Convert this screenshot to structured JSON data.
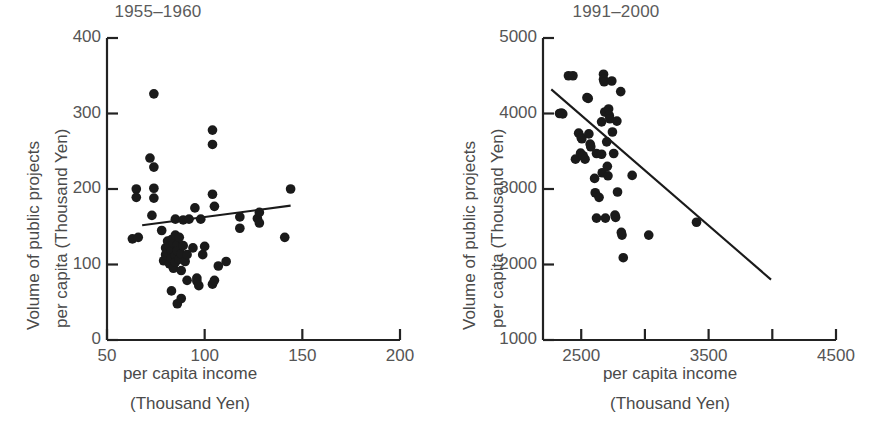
{
  "figure": {
    "background": "#ffffff",
    "ink": "#222222",
    "text_color": "#4a4a4a"
  },
  "shared": {
    "ylabel_line1": "Volume of public projects",
    "ylabel_line2": "per capita (Thousand Yen)",
    "xlabel_line1": "per capita income",
    "xlabel_line2": "(Thousand Yen)"
  },
  "chart_data": [
    {
      "type": "scatter",
      "title": "1955–1960",
      "xlabel": "per capita income (Thousand Yen)",
      "ylabel": "Volume of public projects per capita (Thousand Yen)",
      "xlim": [
        50,
        200
      ],
      "ylim": [
        0,
        400
      ],
      "xticks": [
        50,
        100,
        150,
        200
      ],
      "xtick_labels": [
        "50",
        "100",
        "150",
        "200"
      ],
      "yticks": [
        0,
        100,
        200,
        300,
        400
      ],
      "ytick_labels": [
        "0",
        "100",
        "200",
        "300",
        "400"
      ],
      "grid": false,
      "legend": "none",
      "marker": "filled-circle",
      "marker_color": "#1a1a1a",
      "marker_size": 5,
      "trendline": {
        "label": "regression line",
        "color": "#1a1a1a",
        "x": [
          68,
          144
        ],
        "y": [
          152,
          178
        ]
      },
      "points": [
        {
          "x": 63,
          "y": 134
        },
        {
          "x": 66,
          "y": 136
        },
        {
          "x": 65,
          "y": 200
        },
        {
          "x": 65,
          "y": 189
        },
        {
          "x": 72,
          "y": 241
        },
        {
          "x": 74,
          "y": 229
        },
        {
          "x": 74,
          "y": 326
        },
        {
          "x": 74,
          "y": 201
        },
        {
          "x": 74,
          "y": 188
        },
        {
          "x": 73,
          "y": 165
        },
        {
          "x": 78,
          "y": 145
        },
        {
          "x": 79,
          "y": 105
        },
        {
          "x": 80,
          "y": 113
        },
        {
          "x": 80,
          "y": 122
        },
        {
          "x": 81,
          "y": 131
        },
        {
          "x": 81,
          "y": 116
        },
        {
          "x": 82,
          "y": 101
        },
        {
          "x": 82,
          "y": 124
        },
        {
          "x": 83,
          "y": 133
        },
        {
          "x": 83,
          "y": 118
        },
        {
          "x": 83,
          "y": 108
        },
        {
          "x": 84,
          "y": 95
        },
        {
          "x": 84,
          "y": 128
        },
        {
          "x": 85,
          "y": 112
        },
        {
          "x": 85,
          "y": 139
        },
        {
          "x": 85,
          "y": 103
        },
        {
          "x": 85,
          "y": 160
        },
        {
          "x": 86,
          "y": 126
        },
        {
          "x": 86,
          "y": 118
        },
        {
          "x": 87,
          "y": 107
        },
        {
          "x": 87,
          "y": 136
        },
        {
          "x": 88,
          "y": 114
        },
        {
          "x": 88,
          "y": 92
        },
        {
          "x": 86,
          "y": 48
        },
        {
          "x": 83,
          "y": 65
        },
        {
          "x": 88,
          "y": 55
        },
        {
          "x": 89,
          "y": 125
        },
        {
          "x": 89,
          "y": 159
        },
        {
          "x": 90,
          "y": 104
        },
        {
          "x": 91,
          "y": 113
        },
        {
          "x": 91,
          "y": 79
        },
        {
          "x": 92,
          "y": 160
        },
        {
          "x": 94,
          "y": 122
        },
        {
          "x": 95,
          "y": 175
        },
        {
          "x": 96,
          "y": 78
        },
        {
          "x": 96,
          "y": 82
        },
        {
          "x": 97,
          "y": 72
        },
        {
          "x": 98,
          "y": 160
        },
        {
          "x": 99,
          "y": 113
        },
        {
          "x": 100,
          "y": 124
        },
        {
          "x": 104,
          "y": 278
        },
        {
          "x": 104,
          "y": 259
        },
        {
          "x": 104,
          "y": 193
        },
        {
          "x": 105,
          "y": 177
        },
        {
          "x": 104,
          "y": 74
        },
        {
          "x": 105,
          "y": 79
        },
        {
          "x": 107,
          "y": 98
        },
        {
          "x": 111,
          "y": 104
        },
        {
          "x": 118,
          "y": 163
        },
        {
          "x": 118,
          "y": 148
        },
        {
          "x": 127,
          "y": 161
        },
        {
          "x": 128,
          "y": 169
        },
        {
          "x": 128,
          "y": 155
        },
        {
          "x": 141,
          "y": 136
        },
        {
          "x": 144,
          "y": 200
        }
      ]
    },
    {
      "type": "scatter",
      "title": "1991–2000",
      "xlabel": "per capita income (Thousand Yen)",
      "ylabel": "Volume of public projects per capita (Thousand Yen)",
      "xlim": [
        2200,
        4500
      ],
      "ylim": [
        1000,
        5000
      ],
      "xticks": [
        2500,
        3000,
        3500,
        4000,
        4500
      ],
      "xtick_labels": [
        "2500",
        "",
        "3500",
        "",
        "4500"
      ],
      "yticks": [
        1000,
        2000,
        3000,
        4000,
        5000
      ],
      "ytick_labels": [
        "1000",
        "2000",
        "3000",
        "4000",
        "5000"
      ],
      "grid": false,
      "legend": "none",
      "marker": "filled-circle",
      "marker_color": "#1a1a1a",
      "marker_size": 5,
      "trendline": {
        "label": "regression line",
        "color": "#1a1a1a",
        "x": [
          2265,
          3990
        ],
        "y": [
          4320,
          1800
        ]
      },
      "points": [
        {
          "x": 2330,
          "y": 4000
        },
        {
          "x": 2345,
          "y": 4005
        },
        {
          "x": 2355,
          "y": 3995
        },
        {
          "x": 2400,
          "y": 4500
        },
        {
          "x": 2435,
          "y": 4500
        },
        {
          "x": 2455,
          "y": 3395
        },
        {
          "x": 2480,
          "y": 3740
        },
        {
          "x": 2500,
          "y": 3680
        },
        {
          "x": 2505,
          "y": 3665
        },
        {
          "x": 2495,
          "y": 3475
        },
        {
          "x": 2515,
          "y": 3440
        },
        {
          "x": 2545,
          "y": 4210
        },
        {
          "x": 2555,
          "y": 4200
        },
        {
          "x": 2530,
          "y": 3395
        },
        {
          "x": 2560,
          "y": 3730
        },
        {
          "x": 2570,
          "y": 3595
        },
        {
          "x": 2575,
          "y": 3560
        },
        {
          "x": 2605,
          "y": 3140
        },
        {
          "x": 2610,
          "y": 2950
        },
        {
          "x": 2620,
          "y": 3470
        },
        {
          "x": 2620,
          "y": 2615
        },
        {
          "x": 2640,
          "y": 2890
        },
        {
          "x": 2660,
          "y": 3890
        },
        {
          "x": 2660,
          "y": 3460
        },
        {
          "x": 2665,
          "y": 3215
        },
        {
          "x": 2675,
          "y": 4520
        },
        {
          "x": 2675,
          "y": 4450
        },
        {
          "x": 2680,
          "y": 4420
        },
        {
          "x": 2685,
          "y": 4020
        },
        {
          "x": 2690,
          "y": 2615
        },
        {
          "x": 2700,
          "y": 3625
        },
        {
          "x": 2705,
          "y": 3300
        },
        {
          "x": 2710,
          "y": 3175
        },
        {
          "x": 2715,
          "y": 4060
        },
        {
          "x": 2720,
          "y": 3975
        },
        {
          "x": 2725,
          "y": 3930
        },
        {
          "x": 2740,
          "y": 4430
        },
        {
          "x": 2745,
          "y": 3755
        },
        {
          "x": 2755,
          "y": 3470
        },
        {
          "x": 2765,
          "y": 2655
        },
        {
          "x": 2770,
          "y": 2625
        },
        {
          "x": 2780,
          "y": 3900
        },
        {
          "x": 2785,
          "y": 2960
        },
        {
          "x": 2810,
          "y": 4290
        },
        {
          "x": 2815,
          "y": 2425
        },
        {
          "x": 2820,
          "y": 2390
        },
        {
          "x": 2830,
          "y": 2090
        },
        {
          "x": 2900,
          "y": 3180
        },
        {
          "x": 3030,
          "y": 2390
        },
        {
          "x": 3405,
          "y": 2560
        }
      ]
    }
  ]
}
